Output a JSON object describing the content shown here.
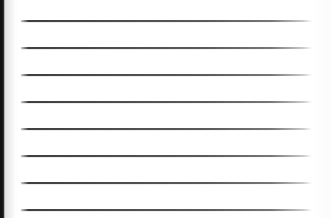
{
  "document": {
    "kind": "scanned-ruled-page",
    "title": "",
    "body_text": "",
    "page_width": 331,
    "page_height": 218,
    "background_color": "#fefefe",
    "has_visible_text": false
  },
  "ruling": {
    "line_count": 8,
    "line_color": "#4c4c4c",
    "line_thickness_px": 1.5,
    "line_spacing_px": 27,
    "line_start_x": 21,
    "line_end_x": 312,
    "line_y_positions": [
      20,
      47,
      74,
      101,
      128,
      155,
      182,
      209
    ],
    "lines": [
      {
        "index": 1,
        "y": 20,
        "content": ""
      },
      {
        "index": 2,
        "y": 47,
        "content": ""
      },
      {
        "index": 3,
        "y": 74,
        "content": ""
      },
      {
        "index": 4,
        "y": 101,
        "content": ""
      },
      {
        "index": 5,
        "y": 128,
        "content": ""
      },
      {
        "index": 6,
        "y": 155,
        "content": ""
      },
      {
        "index": 7,
        "y": 182,
        "content": ""
      },
      {
        "index": 8,
        "y": 209,
        "content": ""
      }
    ]
  },
  "artifacts": {
    "left_edge_band": {
      "name": "page-edge-shadow",
      "color": "#141414",
      "width_px": 5,
      "position": "left"
    }
  }
}
